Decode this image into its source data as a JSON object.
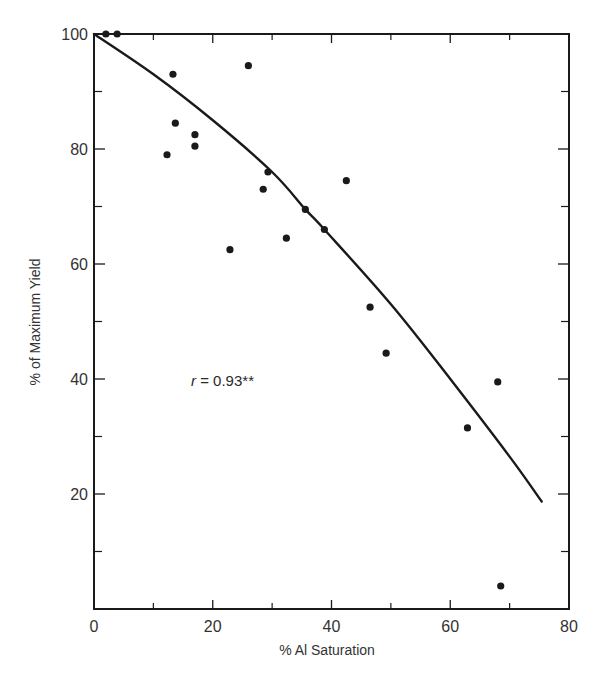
{
  "chart_data": {
    "type": "scatter",
    "title": "",
    "xlabel": "% Al Saturation",
    "ylabel": "% of Maximum Yield",
    "xlim": [
      0,
      80
    ],
    "ylim": [
      0,
      100
    ],
    "x_ticks": [
      0,
      20,
      40,
      60,
      80
    ],
    "x_tick_labels": [
      "0",
      "20",
      "40",
      "60",
      "80"
    ],
    "x_minor_ticks": [
      10,
      30,
      50,
      70
    ],
    "y_ticks": [
      20,
      40,
      60,
      80,
      100
    ],
    "y_tick_labels": [
      "20",
      "40",
      "60",
      "80",
      "100"
    ],
    "y_minor_ticks": [
      10,
      30,
      50,
      70,
      90
    ],
    "grid": false,
    "legend": null,
    "series": [
      {
        "name": "observations",
        "type": "scatter",
        "points": [
          {
            "x": 2.0,
            "y": 100
          },
          {
            "x": 3.9,
            "y": 100
          },
          {
            "x": 13.3,
            "y": 93
          },
          {
            "x": 13.7,
            "y": 84.5
          },
          {
            "x": 17.0,
            "y": 82.5
          },
          {
            "x": 17.0,
            "y": 80.5
          },
          {
            "x": 12.3,
            "y": 79
          },
          {
            "x": 26.0,
            "y": 94.5
          },
          {
            "x": 29.3,
            "y": 76
          },
          {
            "x": 28.5,
            "y": 73
          },
          {
            "x": 35.6,
            "y": 69.5
          },
          {
            "x": 38.8,
            "y": 66
          },
          {
            "x": 42.5,
            "y": 74.5
          },
          {
            "x": 32.4,
            "y": 64.5
          },
          {
            "x": 22.9,
            "y": 62.5
          },
          {
            "x": 46.5,
            "y": 52.5
          },
          {
            "x": 49.2,
            "y": 44.5
          },
          {
            "x": 68.0,
            "y": 39.5
          },
          {
            "x": 62.9,
            "y": 31.5
          },
          {
            "x": 68.5,
            "y": 4
          }
        ]
      },
      {
        "name": "fitted curve",
        "type": "line",
        "points": [
          {
            "x": 0,
            "y": 100
          },
          {
            "x": 10,
            "y": 93
          },
          {
            "x": 20,
            "y": 85
          },
          {
            "x": 30,
            "y": 76
          },
          {
            "x": 35.6,
            "y": 69.5
          },
          {
            "x": 38.8,
            "y": 66
          },
          {
            "x": 50,
            "y": 53
          },
          {
            "x": 60,
            "y": 40
          },
          {
            "x": 70,
            "y": 26.5
          },
          {
            "x": 75.4,
            "y": 18.7
          }
        ]
      }
    ],
    "annotations": [
      {
        "text": "r = 0.93**",
        "x": 16,
        "y": 40
      }
    ]
  },
  "annotation": {
    "r_symbol": "r",
    "r_value": " = 0.93**"
  },
  "style": {
    "ink": "#1a1a1a",
    "text": "#333333",
    "background": "#ffffff"
  }
}
